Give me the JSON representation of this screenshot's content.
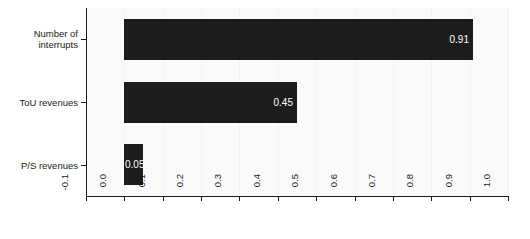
{
  "chart_data": {
    "type": "bar",
    "orientation": "horizontal",
    "title": "",
    "subtitle": "",
    "xlabel": "",
    "ylabel": "",
    "categories": [
      "Number of\ninterrupts",
      "ToU revenues",
      "P/S revenues"
    ],
    "values": [
      0.91,
      0.45,
      0.05
    ],
    "value_labels": [
      "0.91",
      "0.45",
      "0.05"
    ],
    "xlim": [
      -0.1,
      1.0
    ],
    "ylim": [
      0,
      3
    ],
    "xticks": [
      -0.1,
      0.0,
      0.1,
      0.2,
      0.3,
      0.4,
      0.5,
      0.6,
      0.7,
      0.8,
      0.9,
      1.0
    ],
    "xtick_labels": [
      "-0.1",
      "0.0",
      "0.1",
      "0.2",
      "0.3",
      "0.4",
      "0.5",
      "0.6",
      "0.7",
      "0.8",
      "0.9",
      "1.0"
    ],
    "xtick_label_rotation": 90,
    "grid": true,
    "grid_axis": "x",
    "legend": false,
    "legend_position": "none",
    "colors": {
      "bar": "#1c1c1c",
      "value_label": "#ffffff",
      "panel_background": "#fafafa",
      "page_background": "#ffffff",
      "gridline": "#f1f1f1",
      "axis": "#1a1a1a",
      "tick_label": "#1a1a1a"
    },
    "series": [
      {
        "name": "value",
        "points": [
          {
            "category": "Number of interrupts",
            "value": 0.91,
            "label": "0.91"
          },
          {
            "category": "ToU revenues",
            "value": 0.45,
            "label": "0.45"
          },
          {
            "category": "P/S revenues",
            "value": 0.05,
            "label": "0.05"
          }
        ]
      }
    ]
  }
}
